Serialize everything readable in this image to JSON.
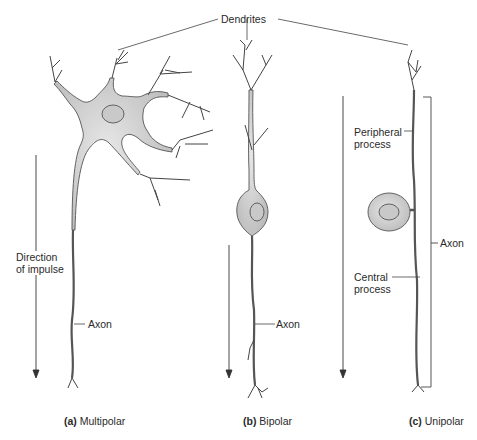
{
  "labels": {
    "dendrites": "Dendrites",
    "direction": [
      "Direction",
      "of impulse"
    ],
    "axon_a": "Axon",
    "axon_b": "Axon",
    "axon_c": "Axon",
    "peripheral": [
      "Peripheral",
      "process"
    ],
    "central": [
      "Central",
      "process"
    ]
  },
  "captions": [
    {
      "tag": "(a)",
      "text": "Multipolar"
    },
    {
      "tag": "(b)",
      "text": "Bipolar"
    },
    {
      "tag": "(c)",
      "text": "Unipolar"
    }
  ],
  "colors": {
    "cell_fill": "#d4d4d4",
    "nucleus_fill": "#c6c6c6",
    "stroke": "#555555",
    "line": "#444444"
  }
}
